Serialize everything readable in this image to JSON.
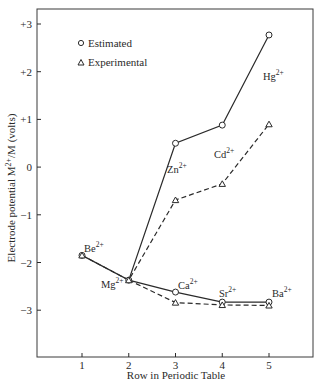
{
  "chart_data": {
    "type": "line",
    "title": "",
    "xlabel": "Row in Periodic Table",
    "ylabel": "Electrode potential M2+/M (volts)",
    "ylabel_parts": {
      "pre": "Electrode potential M",
      "sup": "2+",
      "post": "/M (volts)"
    },
    "x": [
      1,
      2,
      3,
      4,
      5
    ],
    "xticks": [
      "1",
      "2",
      "3",
      "4",
      "5"
    ],
    "yticks": [
      "+3",
      "+2",
      "+1",
      "0",
      "−1",
      "−2",
      "−3"
    ],
    "ytick_values": [
      3,
      2,
      1,
      0,
      -1,
      -2,
      -3
    ],
    "xlim": [
      0.3,
      5.95
    ],
    "ylim": [
      -4,
      3.3
    ],
    "grid": false,
    "legend_position": "upper-left",
    "legend": [
      {
        "label": "Estimated",
        "marker": "○",
        "line": "solid"
      },
      {
        "label": "Experimental",
        "marker": "△",
        "line": "dashed"
      }
    ],
    "series": [
      {
        "name": "Estimated",
        "marker": "circle",
        "line": "solid",
        "branches": [
          {
            "x": [
              1,
              2,
              3,
              4,
              5
            ],
            "values": [
              -1.85,
              -2.37,
              0.5,
              0.88,
              2.77
            ],
            "ions": [
              "Be",
              "Mg",
              "Zn",
              "Cd",
              "Hg"
            ]
          },
          {
            "x": [
              2,
              3,
              4,
              5
            ],
            "values": [
              -2.37,
              -2.62,
              -2.83,
              -2.83
            ],
            "ions": [
              "Mg",
              "Ca",
              "Sr",
              "Ba"
            ]
          }
        ]
      },
      {
        "name": "Experimental",
        "marker": "triangle",
        "line": "dashed",
        "branches": [
          {
            "x": [
              1,
              2,
              3,
              4,
              5
            ],
            "values": [
              -1.85,
              -2.37,
              -0.69,
              -0.35,
              0.9
            ],
            "ions": [
              "Be",
              "Mg",
              "Zn",
              "Cd",
              "Hg"
            ]
          },
          {
            "x": [
              2,
              3,
              4,
              5
            ],
            "values": [
              -2.37,
              -2.84,
              -2.89,
              -2.9
            ],
            "ions": [
              "Mg",
              "Ca",
              "Sr",
              "Ba"
            ]
          }
        ]
      }
    ],
    "annotations": [
      {
        "base": "Hg",
        "sup": "2+",
        "x": 263,
        "y": 80
      },
      {
        "base": "Cd",
        "sup": "2+",
        "x": 214,
        "y": 158
      },
      {
        "base": "Zn",
        "sup": "2+",
        "x": 167,
        "y": 173
      },
      {
        "base": "Be",
        "sup": "2+",
        "x": 84,
        "y": 252
      },
      {
        "base": "Mg",
        "sup": "2+",
        "x": 101,
        "y": 288
      },
      {
        "base": "Ca",
        "sup": "2+",
        "x": 178,
        "y": 289
      },
      {
        "base": "Sr",
        "sup": "2+",
        "x": 219,
        "y": 297
      },
      {
        "base": "Ba",
        "sup": "2+",
        "x": 272,
        "y": 297
      }
    ]
  },
  "colors": {
    "ink": "#2a2a2a",
    "background": "#ffffff"
  }
}
